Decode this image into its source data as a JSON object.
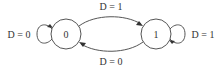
{
  "diagram": {
    "type": "state-machine",
    "states": [
      {
        "id": "s0",
        "label": "0"
      },
      {
        "id": "s1",
        "label": "1"
      }
    ],
    "transitions": [
      {
        "from": "0",
        "to": "0",
        "label": "D = 0"
      },
      {
        "from": "0",
        "to": "1",
        "label": "D = 1"
      },
      {
        "from": "1",
        "to": "0",
        "label": "D = 0"
      },
      {
        "from": "1",
        "to": "1",
        "label": "D = 1"
      }
    ],
    "colors": {
      "stroke": "#555555",
      "text": "#333333",
      "background": "#ffffff"
    }
  }
}
